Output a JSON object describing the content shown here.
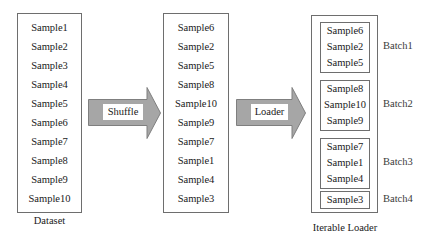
{
  "dataset": {
    "caption": "Dataset",
    "samples": [
      "Sample1",
      "Sample2",
      "Sample3",
      "Sample4",
      "Sample5",
      "Sample6",
      "Sample7",
      "Sample8",
      "Sample9",
      "Sample10"
    ]
  },
  "shuffle_arrow": {
    "label": "Shuffle",
    "icon": "right-arrow-icon"
  },
  "shuffled": {
    "samples": [
      "Sample6",
      "Sample2",
      "Sample5",
      "Sample8",
      "Sample10",
      "Sample9",
      "Sample7",
      "Sample1",
      "Sample4",
      "Sample3"
    ]
  },
  "loader_arrow": {
    "label": "Loader",
    "icon": "right-arrow-icon"
  },
  "iterable_loader": {
    "caption": "Iterable Loader",
    "batches": [
      {
        "label": "Batch1",
        "samples": [
          "Sample6",
          "Sample2",
          "Sample5"
        ]
      },
      {
        "label": "Batch2",
        "samples": [
          "Sample8",
          "Sample10",
          "Sample9"
        ]
      },
      {
        "label": "Batch3",
        "samples": [
          "Sample7",
          "Sample1",
          "Sample4"
        ]
      },
      {
        "label": "Batch4",
        "samples": [
          "Sample3"
        ]
      }
    ]
  },
  "colors": {
    "arrow_fill": "#a6a6a6",
    "arrow_stroke": "#7f7f7f",
    "box_border": "#6e6e6e",
    "text": "#1a1a1a"
  }
}
